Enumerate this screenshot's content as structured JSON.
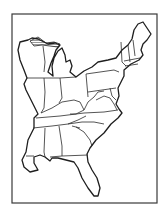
{
  "map": {
    "title": "Eastern United States outline map",
    "region": "Eastern United States",
    "style": "black-and-white outline, state borders, no labels",
    "colors": {
      "background": "#ffffff",
      "line": "#1e1e1e",
      "frame": "#3a3a3a"
    },
    "features": [
      "state-borders",
      "coastline",
      "hatched-lake-superior-shore",
      "rectangular-frame"
    ]
  }
}
